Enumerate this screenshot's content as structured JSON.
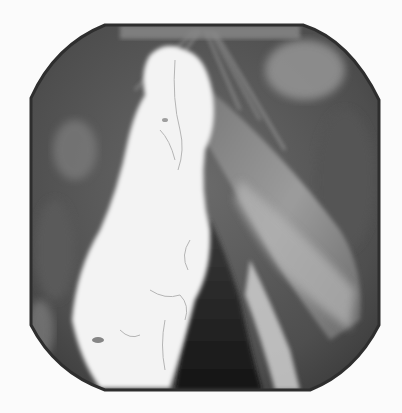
{
  "image": {
    "description": "Grayscale endoscopic view of the larynx within an octagonal frame, showing a large white lobulated lesion on the left vocal fold, a dark glottic gap in the center, and the right vocal fold with a lighter mucosal band.",
    "colors": {
      "background": "#fbfbfb",
      "frame_edge": "#2e2e2e",
      "tissue_dark": "#4a4a4a",
      "tissue_mid": "#6e6e6e",
      "tissue_light": "#a8a8a8",
      "lesion": "#f4f4f4",
      "lumen": "#1e1e1e"
    }
  }
}
